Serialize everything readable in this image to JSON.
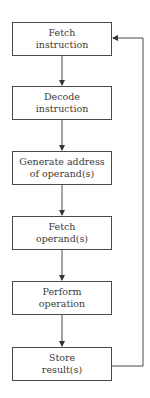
{
  "diagram": {
    "type": "flowchart",
    "steps": [
      {
        "line1": "Fetch",
        "line2": "instruction",
        "top": 22
      },
      {
        "line1": "Decode",
        "line2": "instruction",
        "top": 86
      },
      {
        "line1": "Generate address",
        "line2": "of operand(s)",
        "top": 151
      },
      {
        "line1": "Fetch",
        "line2": "operand(s)",
        "top": 216
      },
      {
        "line1": "Perform",
        "line2": "operation",
        "top": 281
      },
      {
        "line1": "Store",
        "line2": "result(s)",
        "top": 347
      }
    ],
    "loop": "Store result(s) returns to Fetch instruction",
    "colors": {
      "line": "#4a4a4a",
      "text": "#3a3a3a",
      "background": "#ffffff"
    }
  }
}
